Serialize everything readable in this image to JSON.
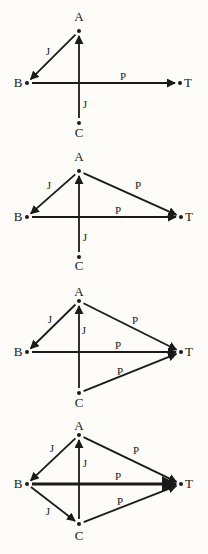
{
  "panels": [
    {
      "id": 1,
      "nodes": {
        "A": {
          "label": "A",
          "x": 79,
          "y": 31,
          "lx": 79,
          "ly": 21,
          "anchor": "middle"
        },
        "B": {
          "label": "B",
          "x": 27,
          "y": 83,
          "lx": 18,
          "ly": 87,
          "anchor": "middle"
        },
        "T": {
          "label": "T",
          "x": 180,
          "y": 83,
          "lx": 188,
          "ly": 87,
          "anchor": "middle"
        },
        "C": {
          "label": "C",
          "x": 79,
          "y": 123,
          "lx": 79,
          "ly": 137,
          "anchor": "middle"
        }
      },
      "edges": [
        {
          "from": "A",
          "to": "B",
          "label": "J",
          "lx": 48,
          "ly": 55,
          "heavy": false
        },
        {
          "from": "B",
          "to": "T",
          "label": "P",
          "lx": 123,
          "ly": 80,
          "heavy": false
        },
        {
          "from": "C",
          "to": "A",
          "label": "J",
          "lx": 85,
          "ly": 108,
          "heavy": false
        }
      ]
    },
    {
      "id": 2,
      "nodes": {
        "A": {
          "label": "A",
          "x": 79,
          "y": 171,
          "lx": 79,
          "ly": 161,
          "anchor": "middle"
        },
        "B": {
          "label": "B",
          "x": 27,
          "y": 217,
          "lx": 18,
          "ly": 221,
          "anchor": "middle"
        },
        "T": {
          "label": "T",
          "x": 181,
          "y": 217,
          "lx": 189,
          "ly": 221,
          "anchor": "middle"
        },
        "C": {
          "label": "C",
          "x": 79,
          "y": 257,
          "lx": 79,
          "ly": 270,
          "anchor": "middle"
        }
      },
      "edges": [
        {
          "from": "A",
          "to": "B",
          "label": "J",
          "lx": 49,
          "ly": 189,
          "heavy": false
        },
        {
          "from": "A",
          "to": "T",
          "label": "P",
          "lx": 138,
          "ly": 189,
          "heavy": false
        },
        {
          "from": "B",
          "to": "T",
          "label": "P",
          "lx": 118,
          "ly": 214,
          "heavy": false
        },
        {
          "from": "C",
          "to": "A",
          "label": "J",
          "lx": 85,
          "ly": 241,
          "heavy": false
        }
      ]
    },
    {
      "id": 3,
      "nodes": {
        "A": {
          "label": "A",
          "x": 79,
          "y": 301,
          "lx": 79,
          "ly": 296,
          "anchor": "middle"
        },
        "B": {
          "label": "B",
          "x": 27,
          "y": 352,
          "lx": 18,
          "ly": 356,
          "anchor": "middle"
        },
        "T": {
          "label": "T",
          "x": 181,
          "y": 352,
          "lx": 189,
          "ly": 356,
          "anchor": "middle"
        },
        "C": {
          "label": "C",
          "x": 79,
          "y": 393,
          "lx": 79,
          "ly": 407,
          "anchor": "middle"
        }
      },
      "edges": [
        {
          "from": "A",
          "to": "B",
          "label": "J",
          "lx": 50,
          "ly": 323,
          "heavy": false
        },
        {
          "from": "A",
          "to": "T",
          "label": "P",
          "lx": 135,
          "ly": 324,
          "heavy": false
        },
        {
          "from": "B",
          "to": "T",
          "label": "P",
          "lx": 118,
          "ly": 349,
          "heavy": false
        },
        {
          "from": "C",
          "to": "A",
          "label": "J",
          "lx": 84,
          "ly": 334,
          "heavy": false
        },
        {
          "from": "C",
          "to": "T",
          "label": "P",
          "lx": 120,
          "ly": 375,
          "heavy": false
        }
      ]
    },
    {
      "id": 4,
      "nodes": {
        "A": {
          "label": "A",
          "x": 79,
          "y": 435,
          "lx": 79,
          "ly": 430,
          "anchor": "middle"
        },
        "B": {
          "label": "B",
          "x": 27,
          "y": 484,
          "lx": 18,
          "ly": 488,
          "anchor": "middle"
        },
        "T": {
          "label": "T",
          "x": 181,
          "y": 484,
          "lx": 189,
          "ly": 488,
          "anchor": "middle"
        },
        "C": {
          "label": "C",
          "x": 79,
          "y": 524,
          "lx": 79,
          "ly": 540,
          "anchor": "middle"
        }
      },
      "edges": [
        {
          "from": "A",
          "to": "B",
          "label": "J",
          "lx": 52,
          "ly": 452,
          "heavy": false
        },
        {
          "from": "A",
          "to": "T",
          "label": "P",
          "lx": 136,
          "ly": 454,
          "heavy": false
        },
        {
          "from": "B",
          "to": "T",
          "label": "P",
          "lx": 118,
          "ly": 480,
          "heavy": true
        },
        {
          "from": "C",
          "to": "A",
          "label": "J",
          "lx": 85,
          "ly": 467,
          "heavy": false
        },
        {
          "from": "C",
          "to": "T",
          "label": "P",
          "lx": 120,
          "ly": 505,
          "heavy": false
        },
        {
          "from": "B",
          "to": "C",
          "label": "J",
          "lx": 48,
          "ly": 515,
          "heavy": false
        }
      ]
    }
  ]
}
